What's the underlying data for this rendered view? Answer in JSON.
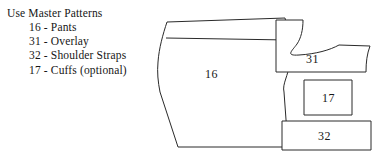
{
  "document": {
    "title": "Use Master Patterns",
    "background_color": "#ffffff",
    "ink_color": "#2a2a2a",
    "text_color": "#161616"
  },
  "instructions": {
    "heading": "Use Master Patterns",
    "items": [
      {
        "number": "16",
        "separator": "-",
        "name": "Pants"
      },
      {
        "number": "31",
        "separator": "-",
        "name": "Overlay"
      },
      {
        "number": "32",
        "separator": "-",
        "name": "Shoulder Straps"
      },
      {
        "number": "17",
        "separator": "-",
        "name": "Cuffs (optional)"
      }
    ]
  },
  "diagram": {
    "pieces": [
      {
        "id": "pants",
        "label": "16",
        "shape": "pants-with-waistband",
        "label_x": 205,
        "label_y": 78
      },
      {
        "id": "overlay",
        "label": "31",
        "shape": "curved-l-overlay",
        "label_x": 313,
        "label_y": 60
      },
      {
        "id": "cuffs",
        "label": "17",
        "shape": "rectangle",
        "label_x": 324,
        "label_y": 101
      },
      {
        "id": "shoulder-straps",
        "label": "32",
        "shape": "rectangle",
        "label_x": 322,
        "label_y": 138
      }
    ]
  }
}
